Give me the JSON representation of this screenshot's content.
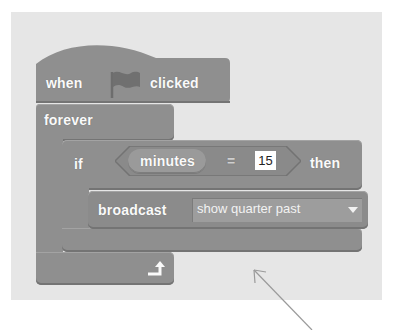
{
  "script": {
    "hat_block": {
      "word_when": "when",
      "icon": "green-flag-icon",
      "word_clicked": "clicked"
    },
    "forever_block": {
      "label": "forever",
      "loop_icon": "loop-arrow-icon"
    },
    "if_block": {
      "label_if": "if",
      "condition": {
        "reporter": "minutes",
        "operator": "=",
        "value": "15"
      },
      "label_then": "then"
    },
    "broadcast_block": {
      "label": "broadcast",
      "message": "show quarter past",
      "dropdown_icon": "dropdown-caret-icon"
    }
  },
  "annotation": {
    "arrow": "pointer-arrow"
  },
  "colors": {
    "panel_bg": "#e6e6e6",
    "block": "#8f8f8f",
    "text": "#fafafa"
  }
}
